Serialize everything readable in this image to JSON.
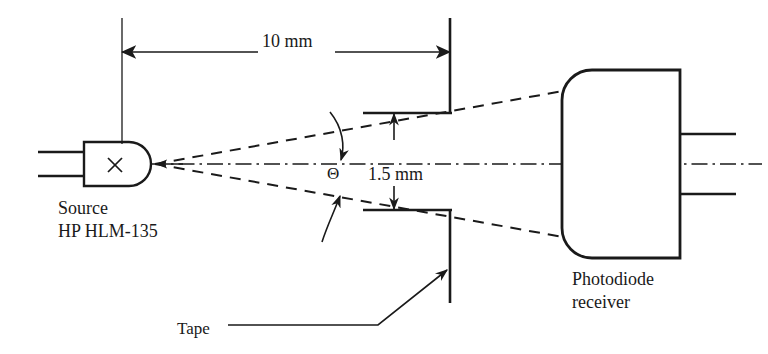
{
  "figure": {
    "type": "optical-link-schematic",
    "title_visible": false,
    "background_color": "#ffffff",
    "line_color": "#1a1a1a"
  },
  "labels": {
    "source_line1": "Source",
    "source_line2": "HP HLM-135",
    "receiver_line1": "Photodiode",
    "receiver_line2": "receiver",
    "tape": "Tape",
    "theta": "Θ"
  },
  "dimensions": {
    "separation": "10 mm",
    "aperture_gap": "1.5 mm"
  },
  "components": {
    "source_symbol": "×",
    "source_leads": 2,
    "receiver_leads": 2,
    "tape_plates": 2
  }
}
